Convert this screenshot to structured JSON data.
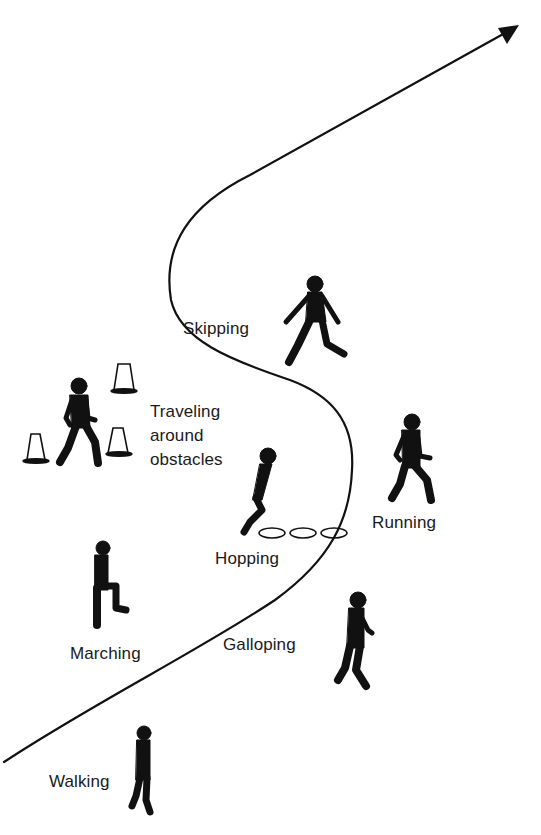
{
  "diagram": {
    "title": "",
    "path": {
      "description": "S-shaped progression path with arrowhead at upper right",
      "stroke_color": "#111111",
      "arrow_direction": "up-right"
    },
    "colors": {
      "background": "#ffffff",
      "silhouette": "#111111",
      "text": "#1a1a1a"
    },
    "stations": [
      {
        "id": "walking",
        "label": "Walking",
        "figure": "walking-child-icon"
      },
      {
        "id": "marching",
        "label": "Marching",
        "figure": "marching-child-icon"
      },
      {
        "id": "galloping",
        "label": "Galloping",
        "figure": "galloping-child-icon"
      },
      {
        "id": "hopping",
        "label": "Hopping",
        "figure": "hopping-child-icon",
        "props": "3 hoop rings"
      },
      {
        "id": "running",
        "label": "Running",
        "figure": "running-child-icon"
      },
      {
        "id": "traveling",
        "label": "Traveling\naround\nobstacles",
        "figure": "traveling-child-icon",
        "props": "3 traffic cones"
      },
      {
        "id": "skipping",
        "label": "Skipping",
        "figure": "skipping-child-icon"
      }
    ]
  }
}
